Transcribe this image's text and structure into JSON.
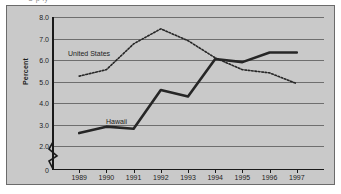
{
  "figure": {
    "top_clipped_text": "U p ly",
    "background_color": "#c9c9c9",
    "border_color": "#6b6b6b"
  },
  "chart_data": {
    "type": "line",
    "title": "",
    "xlabel": "",
    "ylabel": "Percent",
    "x": [
      1989,
      1990,
      1991,
      1992,
      1993,
      1994,
      1995,
      1996,
      1997
    ],
    "xtick_labels": [
      "1989",
      "1990",
      "1991",
      "1992",
      "1993",
      "1994",
      "1995",
      "1996",
      "1997"
    ],
    "ytick_labels": [
      "0",
      "2.0",
      "3.0",
      "4.0",
      "5.0",
      "6.0",
      "7.0",
      "8.0"
    ],
    "ytick_values": [
      0,
      2.0,
      3.0,
      4.0,
      5.0,
      6.0,
      7.0,
      8.0
    ],
    "ylim": [
      2.0,
      8.0
    ],
    "axis_break": true,
    "axis_break_between": [
      0,
      2.0
    ],
    "grid": true,
    "grid_axis": "y",
    "legend": "inline-annotations",
    "series": [
      {
        "name": "Hawaii",
        "style": "solid",
        "color": "#262626",
        "width": 2.6,
        "values": [
          2.6,
          2.9,
          2.8,
          4.6,
          4.3,
          6.05,
          5.9,
          6.35,
          6.35
        ]
      },
      {
        "name": "United States",
        "style": "dotted",
        "color": "#262626",
        "width": 1.6,
        "values": [
          5.25,
          5.55,
          6.75,
          7.45,
          6.9,
          6.1,
          5.55,
          5.4,
          4.9
        ]
      }
    ],
    "annotations": [
      {
        "text": "United States",
        "x": 1989.8,
        "y": 6.45
      },
      {
        "text": "Hawaii",
        "x": 1991.15,
        "y": 3.45
      }
    ]
  }
}
